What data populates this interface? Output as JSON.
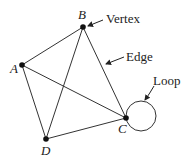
{
  "diagram": {
    "type": "graph",
    "vertices": [
      {
        "id": "A",
        "label": "A",
        "x": 22,
        "y": 65
      },
      {
        "id": "B",
        "label": "B",
        "x": 83,
        "y": 27
      },
      {
        "id": "C",
        "label": "C",
        "x": 126,
        "y": 118
      },
      {
        "id": "D",
        "label": "D",
        "x": 46,
        "y": 139
      }
    ],
    "edges": [
      {
        "from": "A",
        "to": "B"
      },
      {
        "from": "A",
        "to": "C"
      },
      {
        "from": "A",
        "to": "D"
      },
      {
        "from": "B",
        "to": "C"
      },
      {
        "from": "B",
        "to": "D"
      },
      {
        "from": "D",
        "to": "C"
      },
      {
        "from": "C",
        "to": "C",
        "kind": "loop"
      }
    ],
    "annotations": {
      "vertex": "Vertex",
      "edge": "Edge",
      "loop": "Loop"
    }
  }
}
